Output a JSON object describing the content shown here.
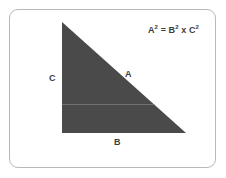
{
  "canvas": {
    "width": 226,
    "height": 178,
    "background_color": "#ffffff"
  },
  "card": {
    "border_color": "#b9b9b9",
    "background_color": "#ffffff",
    "corner_radius": 9
  },
  "diagram": {
    "shape": "right-triangle",
    "fill_color": "#4a4a4a",
    "vertices": [
      {
        "name": "apex-top-left",
        "x": 62,
        "y": 22
      },
      {
        "name": "corner-bottom-left",
        "x": 62,
        "y": 133
      },
      {
        "name": "corner-bottom-right",
        "x": 186,
        "y": 133
      }
    ],
    "guide_line": {
      "name": "horizontal-guide",
      "color": "#6f6f6f",
      "y": 104,
      "x_start": 62,
      "x_end": 154
    },
    "sides": [
      {
        "id": "a",
        "label": "A",
        "role": "hypotenuse",
        "label_x": 125,
        "label_y": 70
      },
      {
        "id": "b",
        "label": "B",
        "role": "base",
        "label_x": 114,
        "label_y": 138
      },
      {
        "id": "c",
        "label": "C",
        "role": "vertical-leg",
        "label_x": 49,
        "label_y": 74
      }
    ],
    "formula": {
      "base_a": "A",
      "exp_a": "2",
      "equals": " = ",
      "base_b": "B",
      "exp_b": "2",
      "operator": " x ",
      "base_c": "C",
      "exp_c": "2",
      "full_text": "A² = B² x C²",
      "text_color": "#3d3d3d"
    }
  }
}
